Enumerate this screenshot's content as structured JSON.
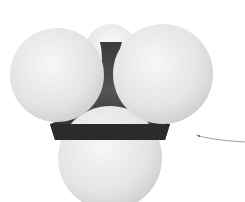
{
  "figure": {
    "atoms": {
      "central": {
        "color": "#2e2e2e"
      },
      "outer": [
        {
          "position": "top-back",
          "color": "#f2f2f2"
        },
        {
          "position": "left",
          "color": "#e6e6e6"
        },
        {
          "position": "right",
          "color": "#e6e6e6"
        },
        {
          "position": "bottom",
          "color": "#e8e8e8"
        }
      ]
    },
    "pointer_line": {
      "color": "#9a9a9a"
    }
  }
}
